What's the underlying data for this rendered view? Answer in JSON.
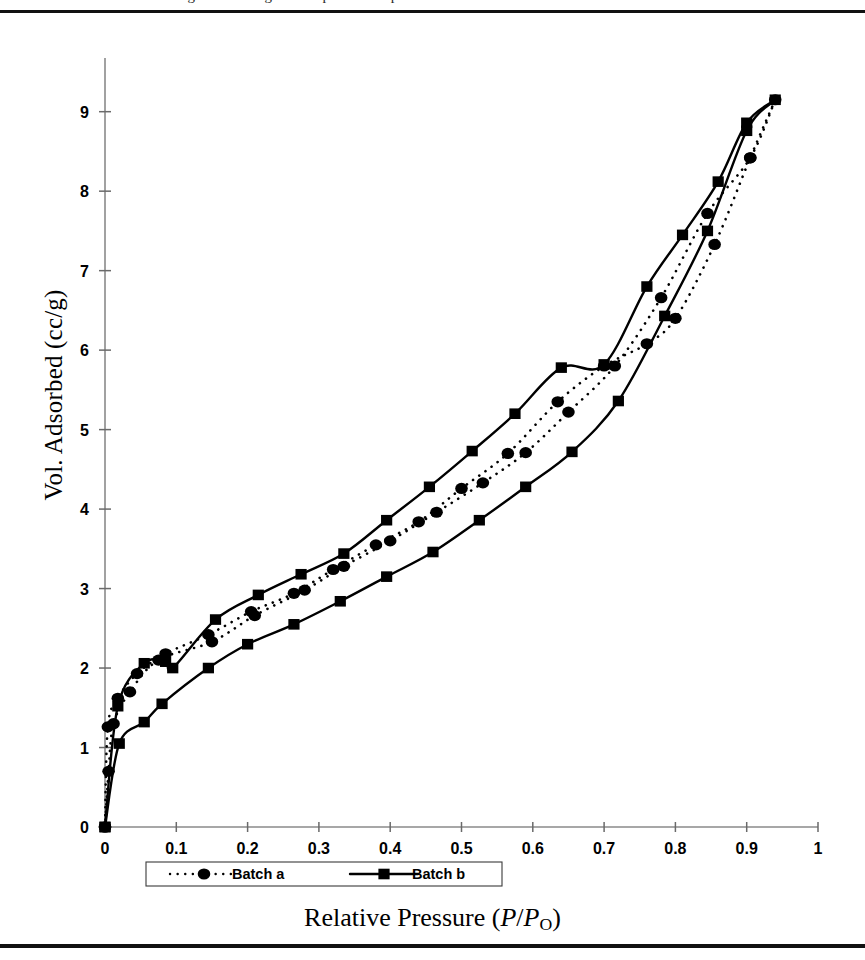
{
  "figure": {
    "cropped_caption_top": "Figure 3. Nitrogen adsorption-desorption isotherms.",
    "y_axis_label": "Vol. Adsorbed (cc/g)",
    "x_axis_label_prefix": "Relative Pressure (",
    "x_axis_label_p1": "P",
    "x_axis_label_slash": "/",
    "x_axis_label_p2": "P",
    "x_axis_label_sub": "O",
    "x_axis_label_suffix": ")"
  },
  "legend": {
    "items": [
      {
        "label": "Batch a",
        "marker": "circle",
        "line": "dotted",
        "color": "#000000"
      },
      {
        "label": "Batch b",
        "marker": "square",
        "line": "solid",
        "color": "#000000"
      }
    ]
  },
  "chart_data": {
    "type": "line",
    "title": "",
    "xlabel": "Relative Pressure (P/Po)",
    "ylabel": "Vol. Adsorbed (cc/g)",
    "xlim": [
      0,
      1
    ],
    "ylim": [
      0,
      9.6
    ],
    "xticks": [
      "0",
      "0.1",
      "0.2",
      "0.3",
      "0.4",
      "0.5",
      "0.6",
      "0.7",
      "0.8",
      "0.9",
      "1"
    ],
    "xtick_values": [
      0,
      0.1,
      0.2,
      0.3,
      0.4,
      0.5,
      0.6,
      0.7,
      0.8,
      0.9,
      1
    ],
    "yticks": [
      "0",
      "1",
      "2",
      "3",
      "4",
      "5",
      "6",
      "7",
      "8",
      "9"
    ],
    "ytick_values": [
      0,
      1,
      2,
      3,
      4,
      5,
      6,
      7,
      8,
      9
    ],
    "grid": false,
    "legend_position": "bottom",
    "series": [
      {
        "name": "Batch a",
        "branch": "adsorption",
        "marker": "circle",
        "line": "dotted",
        "x": [
          0.0,
          0.005,
          0.012,
          0.035,
          0.075,
          0.15,
          0.21,
          0.28,
          0.335,
          0.4,
          0.465,
          0.53,
          0.59,
          0.65,
          0.715,
          0.78,
          0.845,
          0.905,
          0.94
        ],
        "y": [
          0.0,
          0.7,
          1.3,
          1.7,
          2.1,
          2.33,
          2.66,
          2.98,
          3.28,
          3.6,
          3.96,
          4.33,
          4.71,
          5.22,
          5.8,
          6.66,
          7.72,
          8.42,
          9.15
        ]
      },
      {
        "name": "Batch a",
        "branch": "desorption",
        "marker": "circle",
        "line": "dotted",
        "x": [
          0.94,
          0.905,
          0.855,
          0.8,
          0.76,
          0.7,
          0.635,
          0.565,
          0.5,
          0.44,
          0.38,
          0.32,
          0.265,
          0.205,
          0.145,
          0.085,
          0.045,
          0.018,
          0.004,
          0.0
        ],
        "y": [
          9.15,
          8.42,
          7.33,
          6.4,
          6.08,
          5.8,
          5.35,
          4.7,
          4.26,
          3.84,
          3.55,
          3.24,
          2.94,
          2.71,
          2.42,
          2.18,
          1.93,
          1.62,
          1.26,
          0.0
        ]
      },
      {
        "name": "Batch b",
        "branch": "adsorption",
        "marker": "square",
        "line": "solid",
        "x": [
          0.0,
          0.02,
          0.055,
          0.08,
          0.145,
          0.2,
          0.265,
          0.33,
          0.395,
          0.46,
          0.525,
          0.59,
          0.655,
          0.72,
          0.785,
          0.845,
          0.9,
          0.94
        ],
        "y": [
          0.0,
          1.05,
          1.32,
          1.55,
          2.0,
          2.3,
          2.55,
          2.84,
          3.15,
          3.46,
          3.86,
          4.28,
          4.72,
          5.36,
          6.43,
          7.5,
          8.76,
          9.15
        ]
      },
      {
        "name": "Batch b",
        "branch": "desorption",
        "marker": "square",
        "line": "solid",
        "x": [
          0.94,
          0.9,
          0.86,
          0.81,
          0.76,
          0.7,
          0.64,
          0.575,
          0.515,
          0.455,
          0.395,
          0.335,
          0.275,
          0.215,
          0.155,
          0.095,
          0.085,
          0.055,
          0.018,
          0.0
        ],
        "y": [
          9.15,
          8.86,
          8.12,
          7.45,
          6.8,
          5.82,
          5.78,
          5.2,
          4.73,
          4.28,
          3.86,
          3.44,
          3.18,
          2.92,
          2.61,
          2.0,
          2.08,
          2.06,
          1.52,
          0.0
        ]
      }
    ]
  }
}
